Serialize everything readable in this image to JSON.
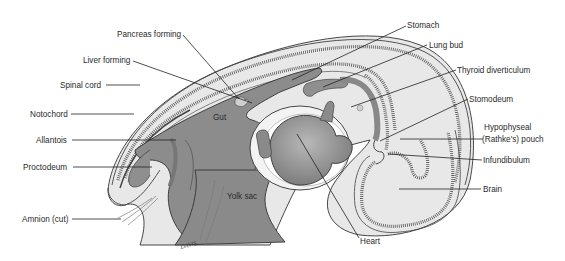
{
  "labels": {
    "pancreas": "Pancreas forming",
    "liver": "Liver forming",
    "spinal_cord": "Spinal cord",
    "notochord": "Notochord",
    "allantois": "Allantois",
    "proctodeum": "Proctodeum",
    "amnion": "Amnion (cut)",
    "gut": "Gut",
    "yolk_sac": "Yolk sac",
    "stomach": "Stomach",
    "lung_bud": "Lung bud",
    "thyroid": "Thyroid diverticulum",
    "stomodeum": "Stomodeum",
    "hypophyseal_1": "Hypophyseal",
    "hypophyseal_2": "(Rathke's) pouch",
    "infundibulum": "Infundibulum",
    "brain": "Brain",
    "heart": "Heart",
    "signature": "DAVIS"
  },
  "colors": {
    "gut": "#8c8c8c",
    "tissue": "#e4e4e4",
    "heart": "#9a9a9a",
    "outline": "#333333"
  }
}
